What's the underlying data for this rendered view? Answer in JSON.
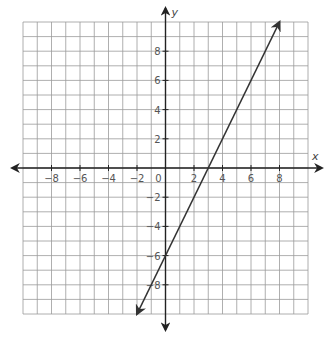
{
  "chart_data": {
    "type": "line",
    "title": "",
    "xlabel": "x",
    "ylabel": "y",
    "xlim": [
      -10,
      10
    ],
    "ylim": [
      -10,
      10
    ],
    "grid": true,
    "grid_step": 1,
    "x_ticks": [
      -8,
      -6,
      -4,
      -2,
      2,
      4,
      6,
      8
    ],
    "y_ticks": [
      -8,
      -6,
      -4,
      -2,
      2,
      4,
      6,
      8
    ],
    "origin_label": "0",
    "series": [
      {
        "name": "y = 2x - 6",
        "equation": "y = 2x - 6",
        "slope": 2,
        "intercept": -6,
        "x": [
          -2,
          0,
          3,
          8
        ],
        "y": [
          -10,
          -6,
          0,
          10
        ],
        "arrows_both_ends": true
      }
    ]
  },
  "colors": {
    "grid": "#9a9a9a",
    "axis": "#222222",
    "line": "#333333",
    "text": "#555555"
  }
}
